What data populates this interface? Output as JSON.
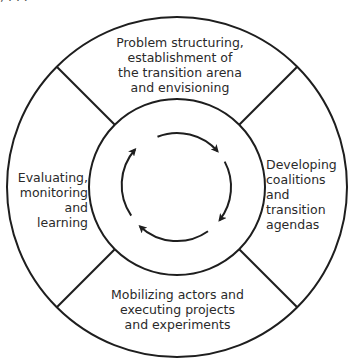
{
  "diagram": {
    "type": "cyclical-process",
    "title_cropped": ", . . .",
    "colors": {
      "stroke": "#1e1e1e",
      "text": "#2a2a2a",
      "background": "#ffffff"
    },
    "geometry": {
      "center": [
        177,
        187
      ],
      "outer_radius": 170,
      "inner_radius": 88,
      "arrow_radius": 54,
      "divider_angles_deg": [
        45,
        135,
        225,
        315
      ]
    },
    "segments": [
      {
        "id": "top",
        "position": "top",
        "label": "Problem structuring,\nestablishment of\nthe transition arena\nand envisioning"
      },
      {
        "id": "right",
        "position": "right",
        "label": "Developing\ncoalitions\nand\ntransition\nagendas"
      },
      {
        "id": "bottom",
        "position": "bottom",
        "label": "Mobilizing actors and\nexecuting projects\nand experiments"
      },
      {
        "id": "left",
        "position": "left",
        "label": "Evaluating,\nmonitoring\nand\nlearning"
      }
    ],
    "cycle": {
      "direction": "clockwise",
      "arrow_count": 4
    }
  }
}
